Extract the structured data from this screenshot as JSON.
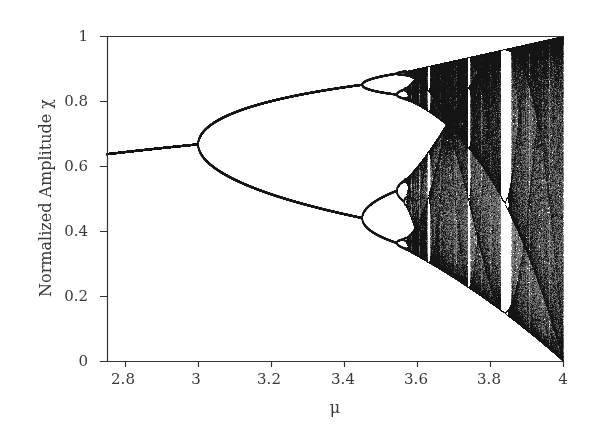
{
  "chart_data": {
    "type": "scatter",
    "title": "",
    "subtitle": "",
    "xlabel": "μ",
    "ylabel": "Normalized Amplitude χ",
    "xlim": [
      2.75,
      4.0
    ],
    "ylim": [
      0,
      1
    ],
    "x_ticks": [
      2.8,
      3,
      3.2,
      3.4,
      3.6,
      3.8,
      4
    ],
    "x_tick_labels": [
      "2.8",
      "3",
      "3.2",
      "3.4",
      "3.6",
      "3.8",
      "4"
    ],
    "y_ticks": [
      0,
      0.2,
      0.4,
      0.6,
      0.8,
      1
    ],
    "y_tick_labels": [
      "0",
      "0.2",
      "0.4",
      "0.6",
      "0.8",
      "1"
    ],
    "grid": false,
    "legend": null,
    "model": {
      "equation": "x_{n+1} = mu * x_n * (1 - x_n)",
      "mu_start": 2.75,
      "mu_end": 4.0,
      "initial_x": 0.5,
      "transient_iterations": 600,
      "plotted_iterations": 900
    },
    "key_points": [
      {
        "mu": 2.75,
        "x": 0.636,
        "note": "single fixed point 1 - 1/mu"
      },
      {
        "mu": 3.0,
        "x": 0.667,
        "note": "first period-doubling bifurcation"
      },
      {
        "mu": 3.449,
        "x": [
          0.44,
          0.85
        ],
        "note": "period-2 to period-4 bifurcation"
      },
      {
        "mu": 3.544,
        "note": "period-4 to period-8"
      },
      {
        "mu": 3.57,
        "note": "onset of chaos"
      },
      {
        "mu": 3.63,
        "note": "period-6 window"
      },
      {
        "mu": 3.74,
        "note": "period-5 window"
      },
      {
        "mu": 3.83,
        "note": "period-3 window"
      },
      {
        "mu": 4.0,
        "x": [
          0,
          1
        ],
        "note": "full chaotic band"
      }
    ],
    "colors": {
      "points": "#1a1a1a",
      "axis": "#333333",
      "background": "#ffffff"
    }
  },
  "labels": {
    "x_axis": "μ",
    "y_axis": "Normalized Amplitude χ",
    "x_ticks": [
      "2.8",
      "3",
      "3.2",
      "3.4",
      "3.6",
      "3.8",
      "4"
    ],
    "y_ticks": [
      "1",
      "0.8",
      "0.6",
      "0.4",
      "0.2",
      "0"
    ]
  }
}
